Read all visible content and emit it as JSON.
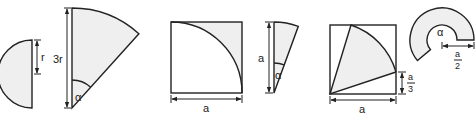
{
  "colors": {
    "fill": "#efefef",
    "stroke": "#222222",
    "background": "#ffffff"
  },
  "figures": [
    {
      "id": "semicircle",
      "labels": {
        "radius": "r"
      }
    },
    {
      "id": "sector-3r",
      "labels": {
        "side": "3r",
        "angle": "α"
      }
    },
    {
      "id": "square-quarter-circle",
      "labels": {
        "side": "a"
      }
    },
    {
      "id": "narrow-sector",
      "labels": {
        "side": "a",
        "angle": "α"
      }
    },
    {
      "id": "square-sector",
      "labels": {
        "side": "a",
        "offset_num": "a",
        "offset_den": "3"
      }
    },
    {
      "id": "annular-sector",
      "labels": {
        "angle": "α",
        "width_num": "a",
        "width_den": "2"
      }
    }
  ]
}
